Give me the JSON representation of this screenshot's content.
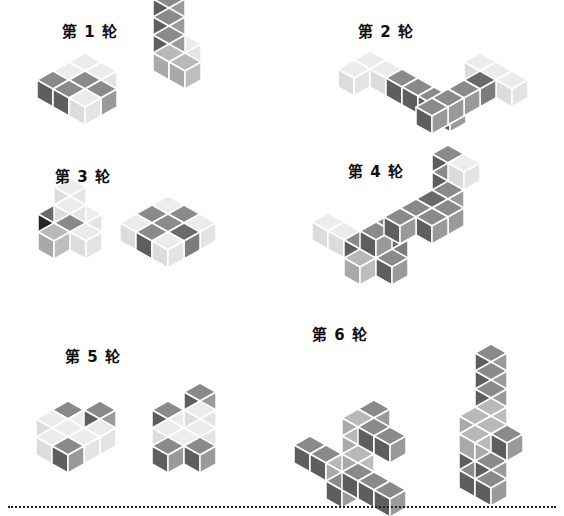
{
  "colors": {
    "light": {
      "top": "#ececec",
      "left": "#dcdcdc",
      "right": "#e4e4e4"
    },
    "mid": {
      "top": "#b9b9b9",
      "left": "#a9a9a9",
      "right": "#bdbdbd"
    },
    "dark": {
      "top": "#8a8a8a",
      "left": "#5e5e5e",
      "right": "#9a9a9a"
    },
    "black": {
      "top": "#6a6a6a",
      "left": "#262626",
      "right": "#7c7c7c"
    },
    "stroke": "#ffffff"
  },
  "rounds": [
    {
      "title": "第 1 轮",
      "title_pos": [
        62,
        20
      ],
      "figures": [
        {
          "origin": [
            85,
            62
          ],
          "cubes": [
            [
              0,
              0,
              0,
              "light"
            ],
            [
              1,
              0,
              0,
              "light"
            ],
            [
              0,
              1,
              0,
              "light"
            ],
            [
              1,
              1,
              0,
              "dark"
            ],
            [
              2,
              1,
              0,
              "dark"
            ],
            [
              2,
              0,
              0,
              "dark"
            ],
            [
              1,
              2,
              0,
              "dark"
            ],
            [
              2,
              2,
              0,
              "light"
            ]
          ]
        },
        {
          "origin": [
            185,
            44
          ],
          "cubes": [
            [
              0,
              0,
              0,
              "light"
            ],
            [
              1,
              0,
              0,
              "mid"
            ],
            [
              1,
              0,
              1,
              "dark"
            ],
            [
              1,
              0,
              2,
              "dark"
            ],
            [
              1,
              0,
              3,
              "dark"
            ],
            [
              1,
              1,
              0,
              "mid"
            ]
          ]
        }
      ]
    },
    {
      "title": "第 2 轮",
      "title_pos": [
        358,
        20
      ],
      "figures": [
        {
          "origin": [
            370,
            60
          ],
          "cubes": [
            [
              0,
              0,
              0,
              "light"
            ],
            [
              1,
              0,
              0,
              "light"
            ],
            [
              0,
              1,
              0,
              "light"
            ],
            [
              0,
              2,
              0,
              "dark"
            ],
            [
              0,
              3,
              0,
              "dark"
            ],
            [
              0,
              4,
              0,
              "dark"
            ],
            [
              0,
              5,
              0,
              "dark"
            ]
          ]
        },
        {
          "origin": [
            480,
            62
          ],
          "cubes": [
            [
              0,
              0,
              0,
              "light"
            ],
            [
              0,
              1,
              0,
              "light"
            ],
            [
              0,
              2,
              0,
              "light"
            ],
            [
              1,
              1,
              0,
              "black"
            ],
            [
              2,
              1,
              0,
              "dark"
            ],
            [
              3,
              1,
              0,
              "dark"
            ],
            [
              4,
              1,
              0,
              "dark"
            ]
          ]
        }
      ]
    },
    {
      "title": "第 3 轮",
      "title_pos": [
        55,
        165
      ],
      "figures": [
        {
          "origin": [
            70,
            205
          ],
          "cubes": [
            [
              0,
              0,
              0,
              "light"
            ],
            [
              0,
              1,
              0,
              "light"
            ],
            [
              1,
              1,
              0,
              "dark"
            ],
            [
              1,
              1,
              1,
              "light"
            ],
            [
              1,
              1,
              2,
              "light"
            ],
            [
              2,
              1,
              0,
              "mid"
            ],
            [
              1,
              2,
              0,
              "light"
            ],
            [
              1,
              0,
              0,
              "black"
            ]
          ]
        },
        {
          "origin": [
            168,
            205
          ],
          "cubes": [
            [
              0,
              0,
              0,
              "light"
            ],
            [
              1,
              0,
              0,
              "dark"
            ],
            [
              2,
              0,
              0,
              "light"
            ],
            [
              0,
              1,
              0,
              "dark"
            ],
            [
              1,
              1,
              0,
              "dark"
            ],
            [
              2,
              1,
              0,
              "dark"
            ],
            [
              1,
              2,
              0,
              "black"
            ],
            [
              0,
              2,
              0,
              "light"
            ],
            [
              2,
              2,
              0,
              "light"
            ]
          ]
        }
      ]
    },
    {
      "title": "第 4 轮",
      "title_pos": [
        348,
        160
      ],
      "figures": [
        {
          "origin": [
            328,
            222
          ],
          "cubes": [
            [
              0,
              0,
              0,
              "light"
            ],
            [
              0,
              1,
              0,
              "light"
            ],
            [
              0,
              2,
              0,
              "dark"
            ],
            [
              0,
              3,
              0,
              "dark"
            ],
            [
              1,
              3,
              0,
              "mid"
            ],
            [
              0,
              4,
              0,
              "dark"
            ],
            [
              0,
              4,
              1,
              "black"
            ],
            [
              0,
              4,
              2,
              "dark"
            ],
            [
              1,
              4,
              2,
              "dark"
            ]
          ]
        },
        {
          "origin": [
            448,
            190
          ],
          "cubes": [
            [
              0,
              0,
              0,
              "dark"
            ],
            [
              0,
              0,
              1,
              "dark"
            ],
            [
              0,
              0,
              2,
              "dark"
            ],
            [
              0,
              1,
              2,
              "light"
            ],
            [
              1,
              0,
              0,
              "black"
            ],
            [
              2,
              0,
              0,
              "dark"
            ],
            [
              1,
              1,
              0,
              "dark"
            ],
            [
              2,
              1,
              0,
              "dark"
            ],
            [
              3,
              0,
              0,
              "dark"
            ]
          ]
        }
      ]
    },
    {
      "title": "第 5 轮",
      "title_pos": [
        65,
        345
      ],
      "figures": [
        {
          "origin": [
            68,
            410
          ],
          "cubes": [
            [
              0,
              0,
              0,
              "dark"
            ],
            [
              0,
              1,
              0,
              "light"
            ],
            [
              0,
              2,
              0,
              "light"
            ],
            [
              1,
              0,
              0,
              "light"
            ],
            [
              1,
              1,
              0,
              "light"
            ],
            [
              1,
              2,
              0,
              "light"
            ],
            [
              2,
              1,
              0,
              "light"
            ],
            [
              2,
              2,
              0,
              "dark"
            ],
            [
              -1,
              1,
              0,
              "dark"
            ],
            [
              0,
              2,
              1,
              "dark"
            ]
          ]
        },
        {
          "origin": [
            168,
            410
          ],
          "cubes": [
            [
              0,
              0,
              0,
              "dark"
            ],
            [
              0,
              1,
              0,
              "light"
            ],
            [
              0,
              2,
              0,
              "light"
            ],
            [
              1,
              1,
              0,
              "light"
            ],
            [
              1,
              2,
              0,
              "light"
            ],
            [
              2,
              2,
              0,
              "dark"
            ],
            [
              0,
              2,
              1,
              "light"
            ],
            [
              0,
              2,
              2,
              "dark"
            ],
            [
              1,
              3,
              0,
              "dark"
            ]
          ]
        }
      ]
    },
    {
      "title": "第 6 轮",
      "title_pos": [
        312,
        323
      ],
      "figures": [
        {
          "origin": [
            310,
            445
          ],
          "cubes": [
            [
              0,
              0,
              0,
              "dark"
            ],
            [
              0,
              1,
              0,
              "dark"
            ],
            [
              0,
              2,
              0,
              "mid"
            ],
            [
              0,
              3,
              0,
              "mid"
            ],
            [
              1,
              3,
              0,
              "dark"
            ],
            [
              0,
              3,
              1,
              "mid"
            ],
            [
              0,
              3,
              2,
              "mid"
            ],
            [
              0,
              3,
              3,
              "mid"
            ],
            [
              -1,
              3,
              3,
              "dark"
            ],
            [
              0,
              4,
              3,
              "dark"
            ],
            [
              0,
              5,
              3,
              "dark"
            ],
            [
              1,
              4,
              1,
              "dark"
            ],
            [
              1,
              5,
              1,
              "dark"
            ],
            [
              1,
              6,
              1,
              "dark"
            ]
          ]
        },
        {
          "origin": [
            475,
            470
          ],
          "cubes": [
            [
              0,
              0,
              0,
              "dark"
            ],
            [
              0,
              0,
              1,
              "dark"
            ],
            [
              0,
              0,
              2,
              "dark"
            ],
            [
              0,
              0,
              3,
              "mid"
            ],
            [
              0,
              1,
              3,
              "mid"
            ],
            [
              0,
              2,
              3,
              "mid"
            ],
            [
              1,
              1,
              3,
              "mid"
            ],
            [
              1,
              2,
              3,
              "mid"
            ],
            [
              -1,
              0,
              3,
              "mid"
            ],
            [
              -1,
              0,
              4,
              "dark"
            ],
            [
              -1,
              0,
              5,
              "dark"
            ],
            [
              -1,
              0,
              6,
              "dark"
            ],
            [
              1,
              2,
              2,
              "dark"
            ],
            [
              1,
              2,
              1,
              "dark"
            ],
            [
              1,
              3,
              4,
              "dark"
            ]
          ]
        }
      ]
    }
  ]
}
